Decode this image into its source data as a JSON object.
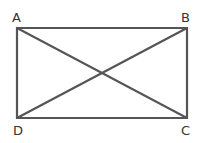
{
  "diagram": {
    "line_color": "#555555",
    "vertices": {
      "A": {
        "label": "A",
        "x": 17,
        "y": 28
      },
      "B": {
        "label": "B",
        "x": 187,
        "y": 28
      },
      "C": {
        "label": "C",
        "x": 187,
        "y": 118
      },
      "D": {
        "label": "D",
        "x": 17,
        "y": 118
      }
    },
    "segments": [
      "AB",
      "BC",
      "CD",
      "DA",
      "AC",
      "BD"
    ]
  }
}
